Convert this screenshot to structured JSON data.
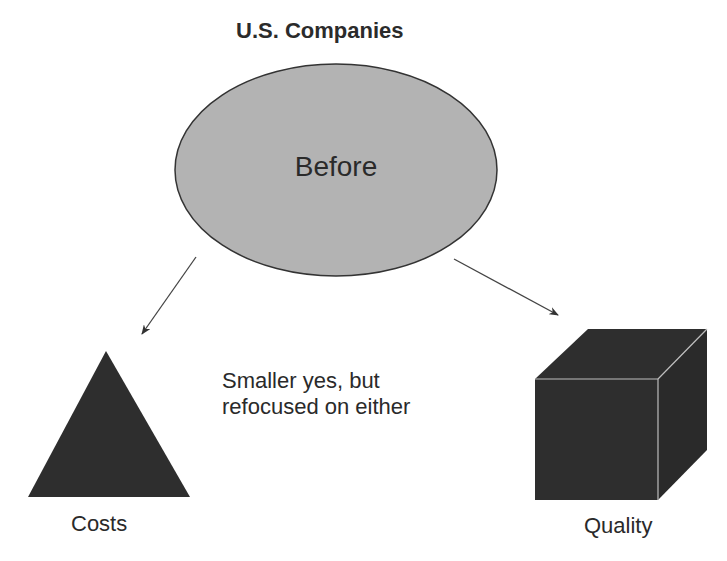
{
  "diagram": {
    "center_node": {
      "label": "Before",
      "shape": "ellipse",
      "fill": "#b3b3b3"
    },
    "left_node": {
      "label": "Costs",
      "shape": "triangle",
      "fill": "#2e2e2e"
    },
    "right_node": {
      "label": "Quality",
      "shape": "cube",
      "fill": "#2e2e2e"
    },
    "annotation_line1": "Smaller yes, but",
    "annotation_line2": "refocused on either",
    "edges": [
      {
        "from": "Before",
        "to": "Costs"
      },
      {
        "from": "Before",
        "to": "Quality"
      }
    ]
  }
}
